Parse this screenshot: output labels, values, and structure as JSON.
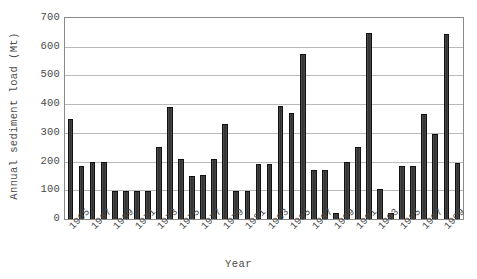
{
  "chart_data": {
    "type": "bar",
    "title": "",
    "subtitle": "",
    "xlabel": "Year",
    "ylabel": "Annual sediment load (Mt)",
    "ylabel_prefix": "Annual sediment load (",
    "ylabel_unit_base": "M",
    "ylabel_unit_sup": "",
    "ylabel_suffix": "t)",
    "ylim": [
      0,
      700
    ],
    "ytick_step": 100,
    "ytick_labels": [
      "0",
      "100",
      "200",
      "300",
      "400",
      "500",
      "600",
      "700"
    ],
    "grid": true,
    "grid_axis": "y",
    "legend": false,
    "legend_position": "none",
    "bar_color": "#3f3f3f",
    "bar_edge_color": "#111111",
    "grid_color": "#b9b9b9",
    "axis_color": "#8a8a8a",
    "text_color": "#4a4a4a",
    "xtick_label_interval": 2,
    "xtick_rotation_deg": -45,
    "categories": [
      "1965",
      "1966",
      "1967",
      "1968",
      "1969",
      "1970",
      "1971",
      "1972",
      "1973",
      "1974",
      "1975",
      "1976",
      "1977",
      "1978",
      "1979",
      "1980",
      "1981",
      "1982",
      "1983",
      "1984",
      "1985",
      "1986",
      "1987",
      "1988",
      "1989",
      "1990",
      "1991",
      "1992",
      "1993",
      "1994",
      "1995",
      "1996",
      "1997",
      "1998",
      "1999",
      "2000"
    ],
    "values": [
      350,
      185,
      200,
      200,
      98,
      98,
      98,
      98,
      250,
      390,
      210,
      150,
      155,
      210,
      330,
      98,
      98,
      190,
      190,
      395,
      370,
      575,
      170,
      170,
      22,
      200,
      250,
      648,
      105,
      20,
      185,
      185,
      365,
      295,
      645,
      195
    ],
    "xtick_labels_shown": [
      "1965",
      "1967",
      "1969",
      "1971",
      "1973",
      "1975",
      "1977",
      "1979",
      "1981",
      "1983",
      "1985",
      "1987",
      "1989",
      "1991",
      "1993",
      "1995",
      "1997",
      "1999"
    ]
  },
  "axes": {
    "y_title": "Annual sediment load (Mt)",
    "x_title": "Year"
  }
}
